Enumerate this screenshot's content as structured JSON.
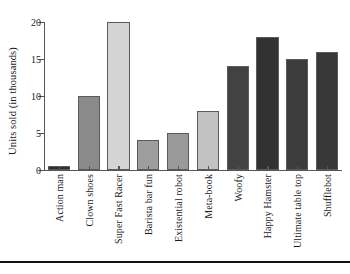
{
  "chart_data": {
    "type": "bar",
    "title": "",
    "xlabel": "",
    "ylabel": "Units sold (in thousands)",
    "categories": [
      "Action man",
      "Clown shoes",
      "Super Fast Racer",
      "Barista bar fun",
      "Existential robot",
      "Meta-book",
      "Woofy",
      "Happy Hamster",
      "Ultimate table top",
      "Shufflebot"
    ],
    "values": [
      0.5,
      10,
      20,
      4,
      5,
      8,
      14,
      18,
      15,
      16
    ],
    "bar_colors": [
      "#2e2e2e",
      "#8a8a8a",
      "#d4d4d4",
      "#9e9e9e",
      "#9a9a9a",
      "#c2c2c2",
      "#424242",
      "#323232",
      "#3c3c3c",
      "#383838"
    ],
    "ylim": [
      0,
      20
    ],
    "yticks": [
      0,
      5,
      10,
      15,
      20
    ],
    "ytick_labels": [
      "0",
      "5",
      "10",
      "15",
      "20"
    ],
    "grid": false,
    "legend": false,
    "bar_edge_color": "#5b5b5b",
    "axis_color": "#555555",
    "background": "#ffffff"
  }
}
